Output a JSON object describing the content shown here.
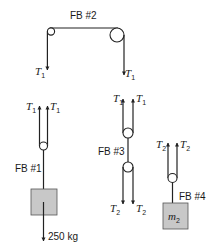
{
  "diagram": {
    "colors": {
      "ink": "#222222",
      "box_fill": "#c8c8c8"
    },
    "fb2": {
      "label": "FB #2",
      "forces": [
        {
          "symbol": "T",
          "sub": "1",
          "direction": "down",
          "side": "left"
        },
        {
          "symbol": "T",
          "sub": "1",
          "direction": "down",
          "side": "right"
        }
      ]
    },
    "fb1": {
      "label": "FB #1",
      "forces": [
        {
          "symbol": "T",
          "sub": "1",
          "direction": "up"
        },
        {
          "symbol": "T",
          "sub": "1",
          "direction": "up"
        }
      ],
      "weight_label": "250 kg"
    },
    "fb3": {
      "label": "FB #3",
      "top_forces": [
        {
          "symbol": "T",
          "sub": "1",
          "direction": "up"
        },
        {
          "symbol": "T",
          "sub": "1",
          "direction": "up"
        }
      ],
      "bottom_forces": [
        {
          "symbol": "T",
          "sub": "2",
          "direction": "down"
        },
        {
          "symbol": "T",
          "sub": "2",
          "direction": "down"
        }
      ]
    },
    "fb4": {
      "label": "FB #4",
      "forces": [
        {
          "symbol": "T",
          "sub": "2",
          "direction": "up"
        },
        {
          "symbol": "T",
          "sub": "2",
          "direction": "up"
        }
      ],
      "mass_symbol": "m",
      "mass_sub": "2"
    }
  }
}
